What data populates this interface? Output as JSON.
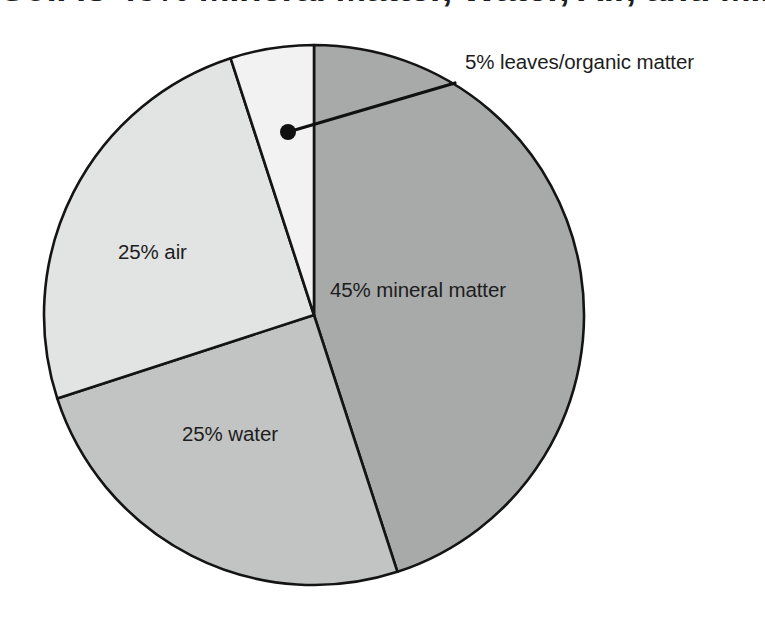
{
  "figure": {
    "title": "Soil is 45% Mineral Matter, Water, Air, and Mineral Matter",
    "title_visible_note": "cropped at top edge",
    "background_color": "#ffffff",
    "outline_color": "#141414"
  },
  "chart_data": {
    "type": "pie",
    "title": "Soil is 45% Mineral Matter, Water, Air, and Mineral Matter",
    "xlabel": "",
    "ylabel": "",
    "grid": false,
    "legend_position": "none",
    "labels_on_slices": true,
    "start_angle_deg": 0,
    "direction": "clockwise",
    "center": {
      "x": 314,
      "y": 315
    },
    "radius": 270,
    "categories": [
      "mineral matter",
      "water",
      "air",
      "leaves/organic matter"
    ],
    "values": [
      45,
      25,
      25,
      5
    ],
    "units": "percent",
    "colors": [
      "#a8a9a9",
      "#c2c3c3",
      "#e2e3e3",
      "#f2f2f2"
    ],
    "slices": [
      {
        "name": "mineral matter",
        "value": 45,
        "label": "45% mineral matter",
        "color": "#a8a9a9",
        "start_deg": 0,
        "end_deg": 162,
        "label_x": 330,
        "label_y": 297,
        "label_anchor": "start",
        "callout": false
      },
      {
        "name": "water",
        "value": 25,
        "label": "25% water",
        "color": "#c2c3c3",
        "start_deg": 162,
        "end_deg": 252,
        "label_x": 182,
        "label_y": 441,
        "label_anchor": "start",
        "callout": false
      },
      {
        "name": "air",
        "value": 25,
        "label": "25% air",
        "color": "#e2e3e3",
        "start_deg": 252,
        "end_deg": 342,
        "label_x": 118,
        "label_y": 259,
        "label_anchor": "start",
        "callout": false
      },
      {
        "name": "leaves/organic matter",
        "value": 5,
        "label": "5% leaves/organic matter",
        "color": "#f2f2f2",
        "start_deg": 342,
        "end_deg": 360,
        "label_x": 465,
        "label_y": 69,
        "label_anchor": "start",
        "callout": true,
        "callout_dot": {
          "x": 288,
          "y": 132
        },
        "callout_elbow": {
          "x": 455,
          "y": 83
        }
      }
    ]
  },
  "labels": {
    "mineral_matter": "45% mineral matter",
    "water": "25% water",
    "air": "25% air",
    "leaves": "5% leaves/organic matter"
  }
}
